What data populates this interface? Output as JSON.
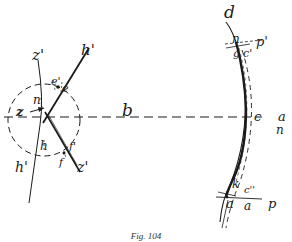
{
  "figure": {
    "caption": "Fig. 104",
    "ink_color": "#1a1a1a",
    "background": "#ffffff"
  },
  "left_group": {
    "labels": {
      "z_prime_top": "z'",
      "h_prime_top": "h'",
      "e_prime": "e'",
      "e": "e",
      "n": "n",
      "z": "z",
      "h": "h",
      "f_prime": "f'",
      "f": "f",
      "h_prime_bottom": "h'",
      "z_prime_bottom": "z'"
    }
  },
  "axis": {
    "label": "b"
  },
  "right_group": {
    "labels": {
      "d": "d",
      "n_top": "n",
      "p_prime": "p'",
      "g": "g",
      "c_prime": "c'",
      "c": "c",
      "a_right": "a",
      "n_right": "n",
      "k": "k",
      "c_double_prime": "c''",
      "p": "p",
      "a_left": "a",
      "a_bottom": "a"
    }
  }
}
